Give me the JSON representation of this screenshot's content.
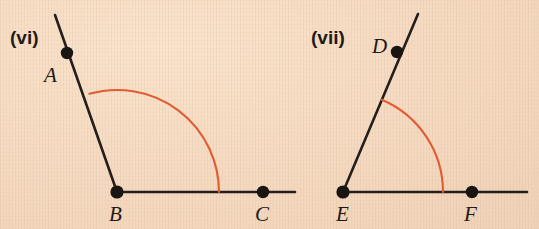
{
  "page": {
    "width": 539,
    "height": 229,
    "background_color": "#f5dcc4",
    "ink_color": "#241f1c",
    "arc_color": "#e15c33"
  },
  "figures": [
    {
      "id": "figure-vi",
      "number_label": "(vi)",
      "number_label_x": 10,
      "number_label_y": 44,
      "vertex": "B",
      "angle_name": "ABC",
      "angle_degrees": 110,
      "arc_radius": 102,
      "points": [
        {
          "name": "A",
          "dot_x": 67,
          "dot_y": 53,
          "label_x": 44,
          "label_y": 82
        },
        {
          "name": "B",
          "dot_x": 117,
          "dot_y": 192,
          "label_x": 109,
          "label_y": 221
        },
        {
          "name": "C",
          "dot_x": 263,
          "dot_y": 192,
          "label_x": 255,
          "label_y": 221
        }
      ],
      "rays": [
        {
          "name": "ray-BA",
          "x1": 117,
          "y1": 192,
          "x2": 55,
          "y2": 15
        },
        {
          "name": "ray-BC",
          "x1": 117,
          "y1": 192,
          "x2": 295,
          "y2": 192
        }
      ],
      "arc": {
        "start_x": 89,
        "start_y": 112,
        "end_x": 219,
        "end_y": 192
      }
    },
    {
      "id": "figure-vii",
      "number_label": "(vii)",
      "number_label_x": 311,
      "number_label_y": 44,
      "vertex": "E",
      "angle_name": "DEF",
      "angle_degrees": 70,
      "arc_radius": 100,
      "points": [
        {
          "name": "D",
          "dot_x": 397,
          "dot_y": 52,
          "label_x": 372,
          "label_y": 53
        },
        {
          "name": "E",
          "dot_x": 343,
          "dot_y": 192,
          "label_x": 336,
          "label_y": 221
        },
        {
          "name": "F",
          "dot_x": 472,
          "dot_y": 192,
          "label_x": 464,
          "label_y": 221
        }
      ],
      "rays": [
        {
          "name": "ray-ED",
          "x1": 343,
          "y1": 192,
          "x2": 418,
          "y2": 14
        },
        {
          "name": "ray-EF",
          "x1": 343,
          "y1": 192,
          "x2": 527,
          "y2": 192
        }
      ],
      "arc": {
        "start_x": 380,
        "start_y": 99,
        "end_x": 443,
        "end_y": 192
      }
    }
  ]
}
